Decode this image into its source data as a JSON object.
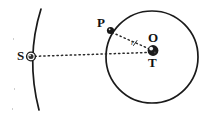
{
  "figure": {
    "type": "geometric-astronomy-diagram",
    "background_color": "#ffffff",
    "ink_color": "#1a1a1a",
    "width": 212,
    "height": 118
  },
  "labels": {
    "sun": "S",
    "point_on_orbit": "P",
    "center": "O",
    "earth": "T",
    "radius": "r"
  },
  "points": {
    "S": {
      "x": 31,
      "y": 57,
      "marker": "filled-circle",
      "marker_radius": 4.2
    },
    "P": {
      "x": 110,
      "y": 30,
      "marker": "filled-circle",
      "marker_radius": 3.4
    },
    "T": {
      "x": 153,
      "y": 51,
      "marker": "filled-sphere",
      "marker_radius": 5.2
    },
    "O": {
      "x": 152,
      "y": 37,
      "marker": "none"
    }
  },
  "shapes": {
    "orbit_circle": {
      "cx": 152,
      "cy": 57,
      "r": 46,
      "stroke_width": 1.6
    },
    "large_arc": {
      "start": {
        "x": 41,
        "y": 9
      },
      "control": {
        "x": 26,
        "y": 57
      },
      "end": {
        "x": 39,
        "y": 110
      },
      "stroke_width": 1.6
    }
  },
  "connectors": [
    {
      "name": "S-to-T",
      "from": "S",
      "to": "T",
      "style": "dotted"
    },
    {
      "name": "P-to-T",
      "from": "P",
      "to": "T",
      "style": "dotted"
    }
  ],
  "colors": {
    "ink": "#1a1a1a",
    "dotted": "#2b2b2b",
    "highlight": "#ffffff"
  }
}
